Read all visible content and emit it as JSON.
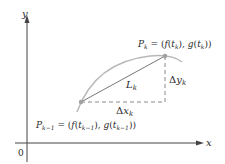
{
  "diagram": {
    "axes": {
      "x_label": "x",
      "y_label": "y",
      "origin_label": "0"
    },
    "points": {
      "p_prev": {
        "name": "P",
        "subscript": "k−1",
        "eq": " = (",
        "f": "f",
        "t": "t",
        "t_sub": "k−1",
        "mid": "), ",
        "g": "g",
        "end": "))"
      },
      "p_curr": {
        "name": "P",
        "subscript": "k",
        "eq": " = (",
        "f": "f",
        "t": "t",
        "t_sub": "k",
        "mid": "), ",
        "g": "g",
        "end": "))"
      }
    },
    "segment_label": {
      "name": "L",
      "subscript": "k"
    },
    "delta_x": {
      "delta": "Δ",
      "var": "x",
      "subscript": "k"
    },
    "delta_y": {
      "delta": "Δ",
      "var": "y",
      "subscript": "k"
    },
    "colors": {
      "curve": "#b8b8b8",
      "axes": "#444444",
      "chord": "#777777",
      "dashes": "#888888",
      "point": "#a0a0a0",
      "text": "#2a2a2a"
    }
  }
}
